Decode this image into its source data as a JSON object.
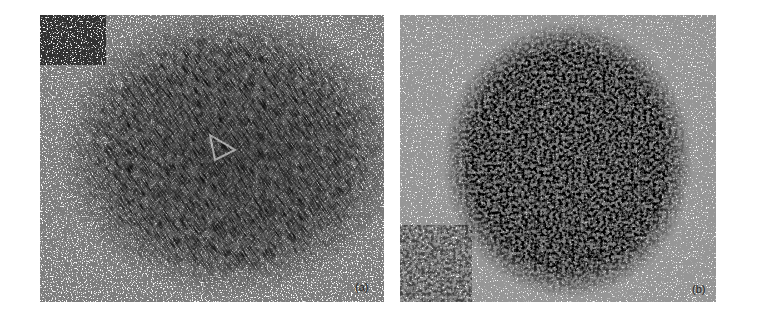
{
  "figure": {
    "panels": [
      {
        "label": "(a)",
        "description": "Dense circular cell colony with nematic swirling alignment and topological defects",
        "texture": "fibrous-swirl",
        "ink_color": "#1e1e1e",
        "background_color": "#fbfbfb"
      },
      {
        "label": "(b)",
        "description": "Dense circular cell colony with granular clustered pattern",
        "texture": "granular-clusters",
        "ink_color": "#1a1a1a",
        "background_color": "#fbfbfb"
      }
    ]
  }
}
